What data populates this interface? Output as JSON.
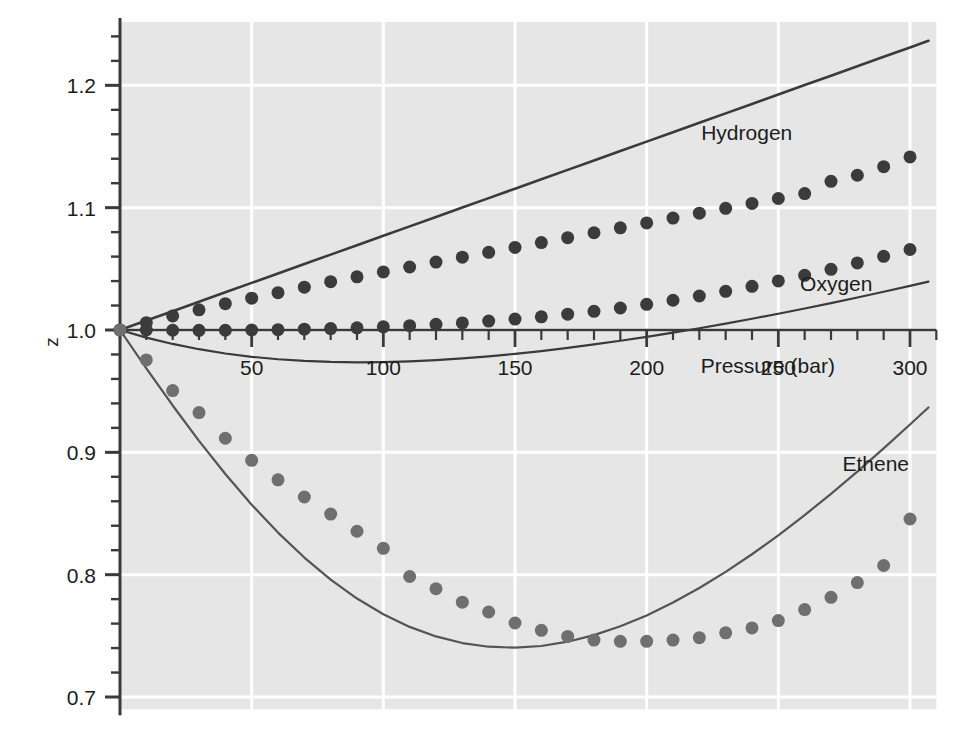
{
  "chart_data": {
    "type": "scatter",
    "title": "",
    "subtitle": "",
    "xlabel": "Pressure (bar)",
    "ylabel": "z",
    "xlim": [
      0,
      310
    ],
    "ylim": [
      0.69,
      1.245
    ],
    "xticks": [
      50,
      100,
      150,
      200,
      250,
      300
    ],
    "xtick_labels": [
      "50",
      "100",
      "150",
      "200",
      "250",
      "300"
    ],
    "x_minor_tick_step": 10,
    "yticks": [
      0.7,
      0.8,
      0.9,
      1.0,
      1.1,
      1.2
    ],
    "ytick_labels": [
      "0.7",
      "0.8",
      "0.9",
      "1.0",
      "1.1",
      "1.2"
    ],
    "y_minor_tick_step": 0.02,
    "grid": true,
    "grid_color": "#ffffff",
    "plot_background": "#e6e6e6",
    "legend_position": "inline-annotations",
    "annotations": [
      {
        "text": "Hydrogen",
        "x": 238,
        "y": 1.155
      },
      {
        "text": "Oxygen",
        "x": 272,
        "y": 1.032
      },
      {
        "text": "Pressure (bar)",
        "x": 246,
        "y": 0.965
      },
      {
        "text": "Ethene",
        "x": 287,
        "y": 0.885
      }
    ],
    "series": [
      {
        "name": "Hydrogen",
        "kind": "line",
        "style": "solid",
        "color": "#3a3a3a",
        "width": 2.6,
        "x": [
          0,
          10,
          20,
          30,
          40,
          50,
          60,
          70,
          80,
          90,
          100,
          110,
          120,
          130,
          140,
          150,
          160,
          170,
          180,
          190,
          200,
          210,
          220,
          230,
          240,
          250,
          260,
          270,
          280,
          290,
          300,
          307
        ],
        "values": [
          1.0,
          1.0077,
          1.0154,
          1.0231,
          1.0308,
          1.0385,
          1.0462,
          1.0539,
          1.0616,
          1.0693,
          1.077,
          1.0847,
          1.0924,
          1.1001,
          1.1078,
          1.1155,
          1.1232,
          1.1309,
          1.1386,
          1.1463,
          1.154,
          1.1617,
          1.1694,
          1.1771,
          1.1848,
          1.1925,
          1.2002,
          1.2079,
          1.2156,
          1.2233,
          1.231,
          1.2364
        ]
      },
      {
        "name": "Hydrogen (data)",
        "kind": "markers",
        "marker": "circle",
        "color": "#3b3b3b",
        "size": 13,
        "x": [
          0,
          10,
          20,
          30,
          40,
          50,
          60,
          70,
          80,
          90,
          100,
          110,
          120,
          130,
          140,
          150,
          160,
          170,
          180,
          190,
          200,
          210,
          220,
          230,
          240,
          250,
          260,
          270,
          280,
          290,
          300
        ],
        "values": [
          1.0,
          1.006,
          1.0115,
          1.0165,
          1.0215,
          1.026,
          1.0305,
          1.035,
          1.0395,
          1.0435,
          1.0475,
          1.0515,
          1.0555,
          1.0595,
          1.0635,
          1.0675,
          1.0715,
          1.0755,
          1.0795,
          1.0835,
          1.0875,
          1.0915,
          1.0955,
          1.0995,
          1.1035,
          1.1075,
          1.1115,
          1.1215,
          1.1265,
          1.1335,
          1.1415
        ]
      },
      {
        "name": "Oxygen",
        "kind": "line",
        "style": "solid",
        "color": "#3a3a3a",
        "width": 2.2,
        "x": [
          0,
          10,
          20,
          30,
          40,
          50,
          60,
          70,
          80,
          90,
          100,
          110,
          120,
          130,
          140,
          150,
          160,
          170,
          180,
          190,
          200,
          210,
          220,
          230,
          240,
          250,
          260,
          270,
          280,
          290,
          300,
          307
        ],
        "values": [
          1.0,
          0.9938,
          0.9886,
          0.9843,
          0.9808,
          0.9781,
          0.9761,
          0.9747,
          0.9739,
          0.9736,
          0.9738,
          0.9744,
          0.9754,
          0.9768,
          0.9785,
          0.9805,
          0.9828,
          0.9854,
          0.9882,
          0.9912,
          0.9944,
          0.9978,
          1.0014,
          1.0052,
          1.0092,
          1.0133,
          1.0176,
          1.022,
          1.0266,
          1.0313,
          1.0361,
          1.0395
        ]
      },
      {
        "name": "Oxygen (data)",
        "kind": "markers",
        "marker": "circle",
        "color": "#3b3b3b",
        "size": 13,
        "x": [
          0,
          10,
          20,
          30,
          40,
          50,
          60,
          70,
          80,
          90,
          100,
          110,
          120,
          130,
          140,
          150,
          160,
          170,
          180,
          190,
          200,
          210,
          220,
          230,
          240,
          250,
          260,
          270,
          280,
          290,
          300
        ],
        "values": [
          1.0,
          1.0,
          0.9998,
          0.9997,
          0.9998,
          1.0,
          1.0003,
          1.0007,
          1.0012,
          1.0018,
          1.0026,
          1.0035,
          1.0046,
          1.0058,
          1.0073,
          1.0089,
          1.0108,
          1.0129,
          1.0153,
          1.018,
          1.021,
          1.0243,
          1.0278,
          1.0316,
          1.0357,
          1.0401,
          1.0447,
          1.0496,
          1.0548,
          1.0602,
          1.0658
        ]
      },
      {
        "name": "Ethene",
        "kind": "line",
        "style": "solid",
        "color": "#545454",
        "width": 2.2,
        "x": [
          0,
          10,
          20,
          30,
          40,
          50,
          60,
          70,
          80,
          90,
          100,
          110,
          120,
          130,
          140,
          150,
          160,
          170,
          180,
          190,
          200,
          210,
          220,
          230,
          240,
          250,
          260,
          270,
          280,
          290,
          300,
          307
        ],
        "values": [
          1.0,
          0.9687,
          0.9383,
          0.9094,
          0.8823,
          0.8572,
          0.8344,
          0.814,
          0.796,
          0.7805,
          0.7676,
          0.7573,
          0.7495,
          0.7441,
          0.7411,
          0.7403,
          0.7417,
          0.7452,
          0.7506,
          0.7578,
          0.7667,
          0.7772,
          0.7891,
          0.8023,
          0.8167,
          0.8322,
          0.8487,
          0.8661,
          0.8843,
          0.9032,
          0.9228,
          0.9367
        ]
      },
      {
        "name": "Ethene (data)",
        "kind": "markers",
        "marker": "circle",
        "color": "#6f6f6f",
        "size": 13,
        "x": [
          0,
          10,
          20,
          30,
          40,
          50,
          60,
          70,
          80,
          90,
          100,
          110,
          120,
          130,
          140,
          150,
          160,
          170,
          180,
          190,
          200,
          210,
          220,
          230,
          240,
          250,
          260,
          270,
          280,
          290,
          300
        ],
        "values": [
          1.0,
          0.9755,
          0.9505,
          0.9325,
          0.9115,
          0.8935,
          0.8775,
          0.8635,
          0.8495,
          0.8355,
          0.8215,
          0.7985,
          0.7885,
          0.7775,
          0.7695,
          0.7605,
          0.7545,
          0.7495,
          0.7465,
          0.7455,
          0.7455,
          0.7465,
          0.7485,
          0.7525,
          0.7565,
          0.7625,
          0.7715,
          0.7815,
          0.7935,
          0.8075,
          0.8455
        ]
      }
    ]
  }
}
